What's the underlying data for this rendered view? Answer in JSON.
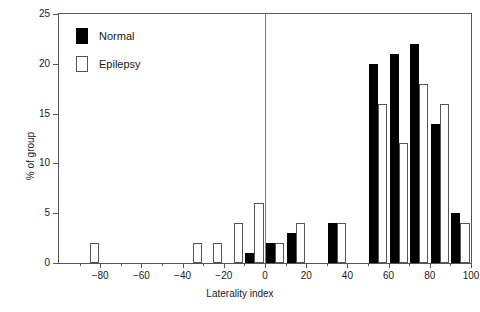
{
  "chart_data": {
    "type": "bar",
    "title": "",
    "xlabel": "Laterality index",
    "ylabel": "% of group",
    "xlim": [
      -100,
      100
    ],
    "ylim": [
      0,
      25
    ],
    "grid": false,
    "legend_position": "top-left",
    "bin_width": 10,
    "x_major_ticks": [
      -80,
      -60,
      -40,
      -20,
      0,
      20,
      40,
      60,
      80,
      100
    ],
    "x_major_tick_labels": [
      "−80",
      "−60",
      "−40",
      "−20",
      "0",
      "20",
      "40",
      "60",
      "80",
      "100"
    ],
    "x_minor_ticks": [
      -90,
      -70,
      -50,
      -30,
      -10,
      10,
      30,
      50,
      70,
      90
    ],
    "y_ticks": [
      0,
      5,
      10,
      15,
      20,
      25
    ],
    "y_tick_labels": [
      "0",
      "5",
      "10",
      "15",
      "20",
      "25"
    ],
    "annotations": [
      "vertical reference line at x = 0"
    ],
    "bins": [
      -100,
      -90,
      -80,
      -70,
      -60,
      -50,
      -40,
      -30,
      -20,
      -10,
      0,
      10,
      20,
      30,
      40,
      50,
      60,
      70,
      80,
      90
    ],
    "series": [
      {
        "name": "Normal",
        "color": "#000000",
        "values": [
          0,
          0,
          0,
          0,
          0,
          0,
          0,
          0,
          0,
          1,
          2,
          3,
          0,
          4,
          0,
          20,
          21,
          22,
          14,
          5
        ]
      },
      {
        "name": "Epilepsy",
        "color": "#ffffff",
        "values": [
          0,
          2,
          0,
          0,
          0,
          0,
          2,
          2,
          4,
          6,
          2,
          4,
          0,
          4,
          0,
          16,
          12,
          18,
          16,
          4
        ]
      }
    ]
  },
  "legend": {
    "items": [
      {
        "label": "Normal",
        "swatch": "filled-black-swatch"
      },
      {
        "label": "Epilepsy",
        "swatch": "open-white-swatch"
      }
    ]
  },
  "axes": {
    "x_title": "Laterality index",
    "y_title": "% of group"
  }
}
